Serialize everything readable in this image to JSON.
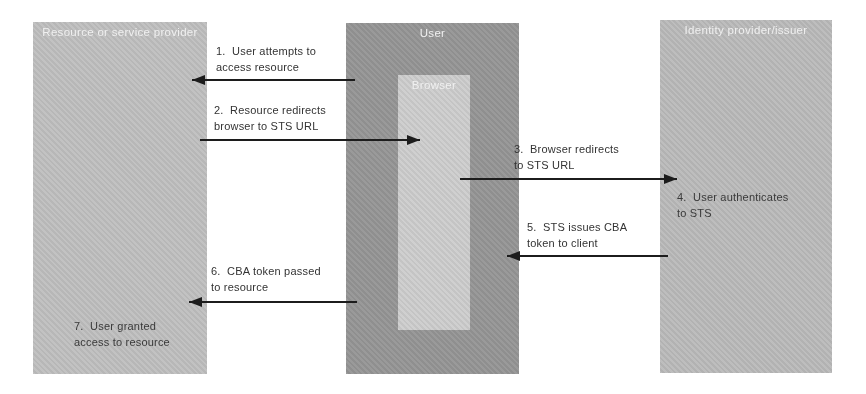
{
  "figure": {
    "boxes": {
      "provider": {
        "title": "Resource or service provider",
        "note": {
          "line1": "7.  User granted",
          "line2": "access to resource"
        }
      },
      "user": {
        "title": "User",
        "browser": {
          "title": "Browser"
        }
      },
      "idp": {
        "title": "Identity provider/issuer",
        "note": {
          "line1": "4.  User authenticates",
          "line2": "to STS"
        }
      }
    },
    "steps": [
      {
        "num": "1",
        "line1": "1.  User attempts to",
        "line2": "access resource",
        "direction": "left",
        "from": "user-box",
        "to": "provider-box"
      },
      {
        "num": "2",
        "line1": "2.  Resource redirects",
        "line2": "browser to STS URL",
        "direction": "right",
        "from": "provider-box",
        "to": "browser-box"
      },
      {
        "num": "3",
        "line1": "3.  Browser redirects",
        "line2": "to STS URL",
        "direction": "right",
        "from": "browser-box",
        "to": "idp-box"
      },
      {
        "num": "5",
        "line1": "5.  STS issues CBA",
        "line2": "token to client",
        "direction": "left",
        "from": "idp-box",
        "to": "user-box"
      },
      {
        "num": "6",
        "line1": "6.  CBA token passed",
        "line2": "to resource",
        "direction": "left",
        "from": "user-box",
        "to": "provider-box"
      }
    ],
    "colors": {
      "background": "#ffffff",
      "provider_box": "#bfbfbf",
      "user_box": "#959595",
      "browser_box": "#cdcdcd",
      "idp_box": "#bababa",
      "box_title_text": "#f0f0f0",
      "label_text": "#333333",
      "arrow": "#1c1c1c"
    }
  }
}
